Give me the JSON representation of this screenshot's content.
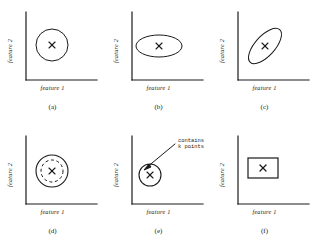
{
  "figure": {
    "background_color": "#ffffff",
    "ink_color": "#1a1a1a",
    "axis_labels": {
      "x": "feature 1",
      "y": "feature 2"
    },
    "center_marker": "×"
  },
  "panels": [
    {
      "id": "a",
      "caption": "(a)",
      "shape": "circle",
      "description": "spherical cluster, equal variance",
      "xlabel": "feature 1",
      "ylabel": "feature 2",
      "marker": "×"
    },
    {
      "id": "b",
      "caption": "(b)",
      "shape": "axis-aligned-ellipse",
      "description": "axis-aligned elliptical cluster, diagonal covariance",
      "xlabel": "feature 1",
      "ylabel": "feature 2",
      "marker": "×"
    },
    {
      "id": "c",
      "caption": "(c)",
      "shape": "rotated-ellipse",
      "description": "rotated elliptical cluster, full covariance",
      "xlabel": "feature 1",
      "ylabel": "feature 2",
      "marker": "×"
    },
    {
      "id": "d",
      "caption": "(d)",
      "shape": "circle-with-dashed-inner-circle",
      "description": "circular cluster with inner dashed boundary",
      "xlabel": "feature 1",
      "ylabel": "feature 2",
      "marker": "×"
    },
    {
      "id": "e",
      "caption": "(e)",
      "shape": "circle-with-annotation",
      "description": "circular neighbourhood annotated as containing k points",
      "xlabel": "feature 1",
      "ylabel": "feature 2",
      "marker": "×",
      "annotation": {
        "line1": "contains",
        "line2": "k points"
      }
    },
    {
      "id": "f",
      "caption": "(f)",
      "shape": "rectangle",
      "description": "rectangular / box-shaped cluster region",
      "xlabel": "feature 1",
      "ylabel": "feature 2",
      "marker": "×"
    }
  ]
}
